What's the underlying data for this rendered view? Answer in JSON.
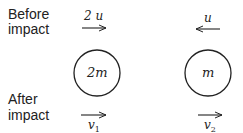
{
  "labels": {
    "before_line1": "Before",
    "before_line2": "impact",
    "after_line1": "After",
    "after_line2": "impact"
  },
  "bodies": [
    {
      "mass_label": "2m",
      "velocity_before": "2u",
      "direction_before": "right",
      "velocity_after": "v1",
      "direction_after": "right"
    },
    {
      "mass_label": "m",
      "velocity_before": "u",
      "direction_before": "left",
      "velocity_after": "v2",
      "direction_after": "right"
    }
  ],
  "display": {
    "v_before_left": "2 u",
    "v_before_right": "u",
    "mass_left": "2m",
    "mass_right": "m",
    "v_after_left_base": "v",
    "v_after_left_sub": "1",
    "v_after_right_base": "v",
    "v_after_right_sub": "2"
  }
}
